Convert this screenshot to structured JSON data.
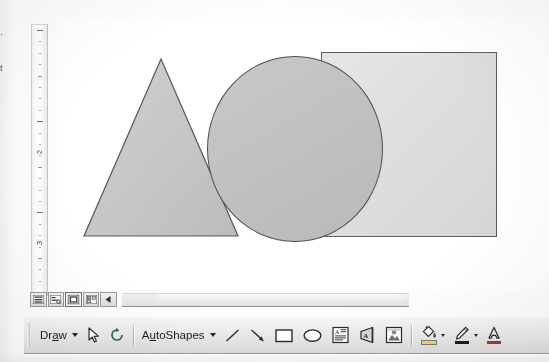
{
  "window": {
    "app": "presentation-editor",
    "left_margin_fragments": [
      "·",
      "t"
    ]
  },
  "ruler": {
    "orientation": "vertical",
    "units": "inches",
    "labels": [
      "2",
      "3"
    ],
    "label_positions_px": [
      127,
      218
    ],
    "tick_spacing_px": 11.4
  },
  "canvas": {
    "background": "#ffffff",
    "shapes": [
      {
        "name": "rectangle",
        "type": "rect",
        "fill": "#dedede",
        "outline": "#5d5d5d",
        "z": 1
      },
      {
        "name": "triangle",
        "type": "isosceles-triangle",
        "fill": "#c6c6c6",
        "outline": "#575757",
        "z": 2
      },
      {
        "name": "circle",
        "type": "oval",
        "fill": "#c2c2c2",
        "outline": "#4f4f4f",
        "z": 3
      }
    ]
  },
  "view_bar": {
    "buttons": [
      {
        "name": "normal-view",
        "label": "Normal View",
        "selected": false
      },
      {
        "name": "outline-view",
        "label": "Outline View",
        "selected": false
      },
      {
        "name": "slide-view",
        "label": "Slide View",
        "selected": true
      },
      {
        "name": "slide-sorter-view",
        "label": "Slide Sorter View",
        "selected": false
      },
      {
        "name": "slide-show-view",
        "label": "Slide Show",
        "selected": false
      }
    ]
  },
  "scrollbar": {
    "orientation": "horizontal",
    "thumb_position_pct": 12
  },
  "toolbar": {
    "title": "Drawing",
    "draw_label": "Draw",
    "draw_label_pre": "Dr",
    "draw_label_key": "a",
    "draw_label_post": "w",
    "autoshapes_label": "AutoShapes",
    "autoshapes_pre": "A",
    "autoshapes_key": "u",
    "autoshapes_post": "toShapes",
    "items": [
      {
        "name": "draw-menu",
        "label": "Draw",
        "has_menu": true
      },
      {
        "name": "select-objects-tool",
        "label": "Select Objects",
        "has_menu": false
      },
      {
        "name": "free-rotate-tool",
        "label": "Free Rotate",
        "has_menu": false
      },
      {
        "name": "autoshapes-menu",
        "label": "AutoShapes",
        "has_menu": true
      },
      {
        "name": "line-tool",
        "label": "Line",
        "has_menu": false
      },
      {
        "name": "arrow-tool",
        "label": "Arrow",
        "has_menu": false
      },
      {
        "name": "rectangle-tool",
        "label": "Rectangle",
        "has_menu": false
      },
      {
        "name": "oval-tool",
        "label": "Oval",
        "has_menu": false
      },
      {
        "name": "text-box-tool",
        "label": "Text Box",
        "has_menu": false
      },
      {
        "name": "wordart-tool",
        "label": "Insert WordArt",
        "has_menu": false
      },
      {
        "name": "insert-picture-tool",
        "label": "Insert Picture",
        "has_menu": false
      },
      {
        "name": "fill-color-tool",
        "label": "Fill Color",
        "has_menu": true,
        "color": "#f5d34a"
      },
      {
        "name": "line-color-tool",
        "label": "Line Color",
        "has_menu": true,
        "color": "#1c1c1c"
      },
      {
        "name": "font-color-tool",
        "label": "Font Color",
        "has_menu": true,
        "color": "#b03030"
      }
    ]
  }
}
